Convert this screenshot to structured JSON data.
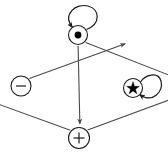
{
  "diagram": {
    "type": "state-transition-graph",
    "background_color": "#ffffff",
    "node_stroke_color": "#1a1a1a",
    "edge_color": "#4a4a4a",
    "loop_color": "#1a1a1a",
    "nodes": [
      {
        "id": "bullet",
        "glyph": "dot-icon",
        "label": "●",
        "name": "node-bullet",
        "cx": 78,
        "cy": 35,
        "r": 9.5
      },
      {
        "id": "minus",
        "glyph": "minus-icon",
        "label": "−",
        "name": "node-minus",
        "cx": 21,
        "cy": 86,
        "r": 10
      },
      {
        "id": "star",
        "glyph": "star-icon",
        "label": "★",
        "name": "node-star",
        "cx": 133,
        "cy": 88,
        "r": 9.5
      },
      {
        "id": "plus",
        "glyph": "plus-icon",
        "label": "+",
        "name": "node-plus",
        "cx": 79,
        "cy": 138,
        "r": 10.5
      }
    ],
    "edges": [
      {
        "from": "minus",
        "to": "bullet",
        "name": "edge-minus-to-bullet",
        "arrow": "at-target"
      },
      {
        "from": "bullet",
        "to": "star",
        "name": "edge-bullet-to-star",
        "arrow": "at-target"
      },
      {
        "from": "plus",
        "to": "minus",
        "name": "edge-plus-to-minus",
        "arrow": "at-target"
      },
      {
        "from": "plus",
        "to": "star",
        "name": "edge-plus-to-star",
        "arrow": "at-target"
      },
      {
        "from": "bullet",
        "to": "plus",
        "name": "edge-bullet-to-plus",
        "arrow": "at-target"
      }
    ],
    "self_loops": [
      {
        "on": "bullet",
        "name": "self-loop-bullet",
        "direction": "up",
        "arrow": "at-source"
      },
      {
        "on": "star",
        "name": "self-loop-star",
        "direction": "right",
        "arrow": "at-source"
      }
    ]
  }
}
